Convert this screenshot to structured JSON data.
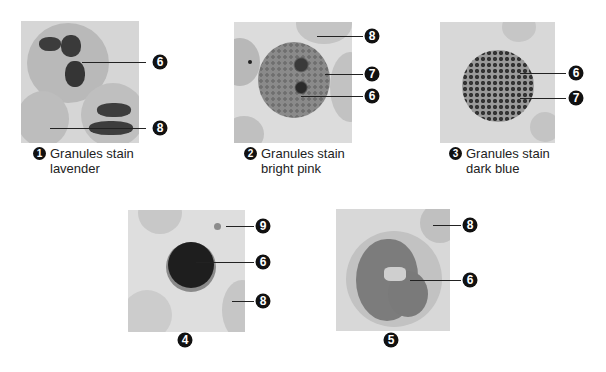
{
  "figure": {
    "panels": [
      {
        "id": 1,
        "number": "1",
        "caption_line1": "Granules stain",
        "caption_line2": "lavender",
        "callouts": [
          "6",
          "8"
        ]
      },
      {
        "id": 2,
        "number": "2",
        "caption_line1": "Granules stain",
        "caption_line2": "bright pink",
        "callouts": [
          "8",
          "7",
          "6"
        ]
      },
      {
        "id": 3,
        "number": "3",
        "caption_line1": "Granules stain",
        "caption_line2": "dark blue",
        "callouts": [
          "6",
          "7"
        ]
      },
      {
        "id": 4,
        "number": "4",
        "callouts": [
          "9",
          "6",
          "8"
        ]
      },
      {
        "id": 5,
        "number": "5",
        "callouts": [
          "8",
          "6"
        ]
      }
    ],
    "colors": {
      "background": "#ffffff",
      "micrograph_bg": "#d9d9d9",
      "label_fill": "#111111",
      "label_text": "#ffffff"
    }
  }
}
